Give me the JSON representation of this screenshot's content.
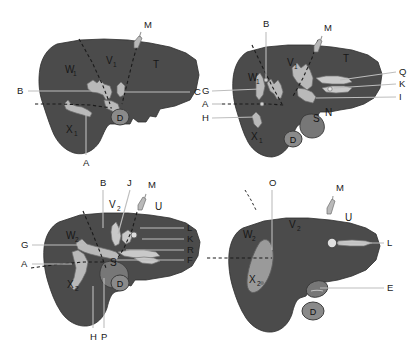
{
  "figure": {
    "panel_count": 4,
    "colors": {
      "liver_parenchyma": "#4b4b4b",
      "vessel": "#b9b9b9",
      "organ": "#777777",
      "lesion": "#9a9a9a",
      "background": "#ffffff",
      "leader_line": "#bdbdbd",
      "dashed_line": "#1b1b1b"
    },
    "panels": [
      {
        "id": "panel-top-left",
        "name": "top-left-liver-diagram",
        "region_labels": [
          {
            "key": "W1",
            "base": "W",
            "sub": "1"
          },
          {
            "key": "V1",
            "base": "V",
            "sub": "1"
          },
          {
            "key": "T",
            "base": "T",
            "sub": ""
          },
          {
            "key": "X1",
            "base": "X",
            "sub": "1"
          }
        ],
        "leader_labels": [
          "B",
          "C",
          "M",
          "A"
        ],
        "circle_labels": [
          "D"
        ]
      },
      {
        "id": "panel-top-right",
        "name": "top-right-liver-diagram",
        "region_labels": [
          {
            "key": "W1",
            "base": "W",
            "sub": "1"
          },
          {
            "key": "V1",
            "base": "V",
            "sub": "1"
          },
          {
            "key": "T",
            "base": "T",
            "sub": ""
          },
          {
            "key": "X1",
            "base": "X",
            "sub": "1"
          }
        ],
        "leader_labels": [
          "B",
          "M",
          "Q",
          "K",
          "I",
          "G",
          "A",
          "H",
          "S",
          "N"
        ],
        "circle_labels": [
          "D"
        ]
      },
      {
        "id": "panel-bottom-left",
        "name": "bottom-left-liver-diagram",
        "region_labels": [
          {
            "key": "W2",
            "base": "W",
            "sub": "2"
          },
          {
            "key": "V2",
            "base": "V",
            "sub": "2"
          },
          {
            "key": "U",
            "base": "U",
            "sub": ""
          },
          {
            "key": "X2",
            "base": "X",
            "sub": "2"
          }
        ],
        "leader_labels": [
          "B",
          "J",
          "M",
          "L",
          "K",
          "R",
          "F",
          "G",
          "A",
          "H",
          "P",
          "S"
        ],
        "circle_labels": [
          "D"
        ]
      },
      {
        "id": "panel-bottom-right",
        "name": "bottom-right-liver-diagram",
        "region_labels": [
          {
            "key": "W2",
            "base": "W",
            "sub": "2"
          },
          {
            "key": "V2",
            "base": "V",
            "sub": "2"
          },
          {
            "key": "U",
            "base": "U",
            "sub": ""
          },
          {
            "key": "X2",
            "base": "X",
            "sub": "2"
          }
        ],
        "leader_labels": [
          "O",
          "M",
          "L",
          "E"
        ],
        "circle_labels": [
          "D"
        ]
      }
    ],
    "labels": {
      "p1_W": "W",
      "p1_W_sub": "1",
      "p1_V": "V",
      "p1_V_sub": "1",
      "p1_T": "T",
      "p1_X": "X",
      "p1_X_sub": "1",
      "p1_B": "B",
      "p1_C": "C",
      "p1_M": "M",
      "p1_A": "A",
      "p1_D": "D",
      "p2_W": "W",
      "p2_W_sub": "1",
      "p2_V": "V",
      "p2_V_sub": "1",
      "p2_T": "T",
      "p2_X": "X",
      "p2_X_sub": "1",
      "p2_B": "B",
      "p2_M": "M",
      "p2_Q": "Q",
      "p2_K": "K",
      "p2_I": "I",
      "p2_G": "G",
      "p2_A": "A",
      "p2_H": "H",
      "p2_S": "S",
      "p2_N": "N",
      "p2_D": "D",
      "p3_W": "W",
      "p3_W_sub": "2",
      "p3_V": "V",
      "p3_V_sub": "2",
      "p3_U": "U",
      "p3_X": "X",
      "p3_X_sub": "2",
      "p3_B": "B",
      "p3_J": "J",
      "p3_M": "M",
      "p3_L": "L",
      "p3_K": "K",
      "p3_R": "R",
      "p3_F": "F",
      "p3_G": "G",
      "p3_A": "A",
      "p3_H": "H",
      "p3_P": "P",
      "p3_S": "S",
      "p3_D": "D",
      "p4_W": "W",
      "p4_W_sub": "2",
      "p4_V": "V",
      "p4_V_sub": "2",
      "p4_U": "U",
      "p4_X": "X",
      "p4_X_sub": "2",
      "p4_O": "O",
      "p4_M": "M",
      "p4_L": "L",
      "p4_E": "E",
      "p4_D": "D"
    }
  }
}
